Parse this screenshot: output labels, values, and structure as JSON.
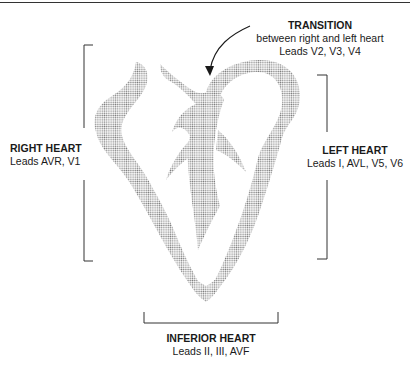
{
  "diagram": {
    "regions": {
      "transition": {
        "title": "TRANSITION",
        "subtitle": "between right and left heart",
        "leads": "Leads V2, V3, V4"
      },
      "right_heart": {
        "title": "RIGHT HEART",
        "leads": "Leads AVR, V1"
      },
      "left_heart": {
        "title": "LEFT HEART",
        "leads": "Leads I, AVL, V5, V6"
      },
      "inferior_heart": {
        "title": "INFERIOR HEART",
        "leads": "Leads II, III, AVF"
      }
    },
    "colors": {
      "stipple": "#8a8a8a",
      "ink": "#1a1a1a"
    }
  }
}
